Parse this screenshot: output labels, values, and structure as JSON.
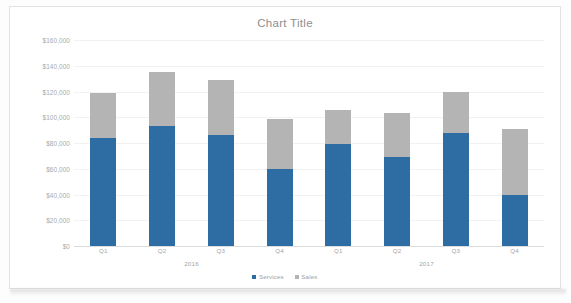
{
  "chart_data": {
    "type": "bar",
    "title": "Chart Title",
    "subtype": "stacked-column",
    "xlabel": "",
    "ylabel": "",
    "ylim": [
      0,
      160000
    ],
    "ytick_step": 20000,
    "ytick_labels": [
      "$160,000",
      "$140,000",
      "$120,000",
      "$100,000",
      "$80,000",
      "$60,000",
      "$40,000",
      "$20,000",
      "$0"
    ],
    "ytick_values": [
      160000,
      140000,
      120000,
      100000,
      80000,
      60000,
      40000,
      20000,
      0
    ],
    "categories": [
      "Q1",
      "Q2",
      "Q3",
      "Q4",
      "Q1",
      "Q2",
      "Q3",
      "Q4"
    ],
    "group_labels": [
      "2016",
      "2017"
    ],
    "grid": true,
    "legend_position": "bottom",
    "series": [
      {
        "name": "Services",
        "color": "#2e6ca4",
        "values": [
          84000,
          93000,
          86000,
          60000,
          79000,
          69000,
          88000,
          40000
        ]
      },
      {
        "name": "Sales",
        "color": "#b4b4b4",
        "values": [
          35000,
          42000,
          43000,
          39000,
          27000,
          34000,
          32000,
          51000
        ]
      }
    ],
    "totals": [
      119000,
      135000,
      129000,
      99000,
      106000,
      103000,
      120000,
      91000
    ]
  }
}
